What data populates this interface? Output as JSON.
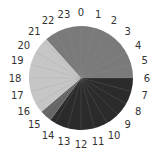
{
  "chart_data": {
    "type": "pie",
    "title": "",
    "hour_labels": [
      "0",
      "1",
      "2",
      "3",
      "4",
      "5",
      "6",
      "7",
      "8",
      "9",
      "10",
      "11",
      "12",
      "13",
      "14",
      "15",
      "16",
      "17",
      "18",
      "19",
      "20",
      "21",
      "22",
      "23"
    ],
    "slices": [
      {
        "name": "segment-1",
        "start_hour": 21.2,
        "end_hour": 30.0,
        "hours": 8.8,
        "color": "#7a7a7a"
      },
      {
        "name": "segment-2",
        "start_hour": 6.0,
        "end_hour": 14.4,
        "hours": 8.4,
        "color": "#2b2b2b"
      },
      {
        "name": "segment-3",
        "start_hour": 14.4,
        "end_hour": 15.3,
        "hours": 0.9,
        "color": "#666666"
      },
      {
        "name": "segment-4",
        "start_hour": 15.3,
        "end_hour": 21.2,
        "hours": 5.9,
        "color": "#c6c6c6"
      }
    ],
    "hour_grid_lines": true,
    "grid_color": "#9a9a9a"
  }
}
